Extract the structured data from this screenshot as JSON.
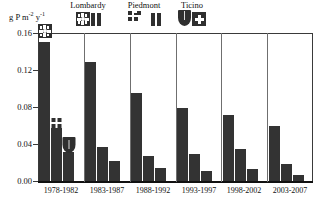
{
  "axis": {
    "unit_label": "g P m",
    "unit_sup1": "-2",
    "unit_mid": " y",
    "unit_sup2": "-1",
    "yticks": [
      "0.16",
      "0.12",
      "0.08",
      "0.04",
      "0.00"
    ]
  },
  "legend": {
    "items": [
      {
        "label": "Lombardy",
        "icon": "lombardy-rose-emblem"
      },
      {
        "label": "Piedmont",
        "icon": "piedmont-checkered-emblem"
      },
      {
        "label": "Ticino",
        "icon": "ticino-shield-emblem"
      }
    ]
  },
  "chart_data": {
    "type": "bar",
    "title": "",
    "xlabel": "",
    "ylabel": "g P m-2 y-1",
    "ylim": [
      0.0,
      0.16
    ],
    "yticks": [
      0.0,
      0.04,
      0.08,
      0.12,
      0.16
    ],
    "grid": false,
    "legend_position": "top",
    "categories": [
      "1978-1982",
      "1983-1987",
      "1988-1992",
      "1993-1997",
      "1998-2002",
      "2003-2007"
    ],
    "series": [
      {
        "name": "Lombardy",
        "values": [
          0.15,
          0.129,
          0.095,
          0.079,
          0.071,
          0.06
        ]
      },
      {
        "name": "Piedmont",
        "values": [
          0.057,
          0.037,
          0.027,
          0.029,
          0.035,
          0.018
        ]
      },
      {
        "name": "Ticino",
        "values": [
          0.031,
          0.022,
          0.014,
          0.011,
          0.013,
          0.007
        ]
      }
    ]
  },
  "colors": {
    "bar": "#333333",
    "frame": "#3a3a3a",
    "separator": "#6f6f6f",
    "background": "#ffffff"
  }
}
